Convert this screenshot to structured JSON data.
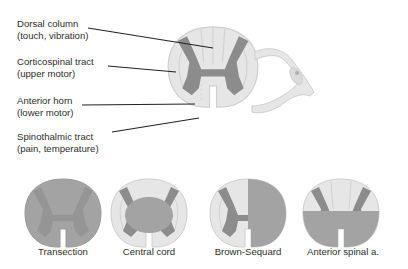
{
  "diagram": {
    "main_labels": [
      {
        "line1": "Dorsal column",
        "line2": "(touch, vibration)"
      },
      {
        "line1": "Corticospinal tract",
        "line2": "(upper motor)"
      },
      {
        "line1": "Anterior horn",
        "line2": "(lower motor)"
      },
      {
        "line1": "Spinothalmic tract",
        "line2": "(pain, temperature)"
      }
    ],
    "lesions": [
      {
        "label": "Transection"
      },
      {
        "label": "Central cord"
      },
      {
        "label": "Brown-Sequard"
      },
      {
        "label": "Anterior spinal a."
      }
    ],
    "colors": {
      "white_matter": "#e6e6e6",
      "white_matter_stroke": "#cfcfcf",
      "gray_matter": "#8c8c8c",
      "lesion_fill": "#a3a3a3",
      "leader_line": "#222222"
    }
  }
}
